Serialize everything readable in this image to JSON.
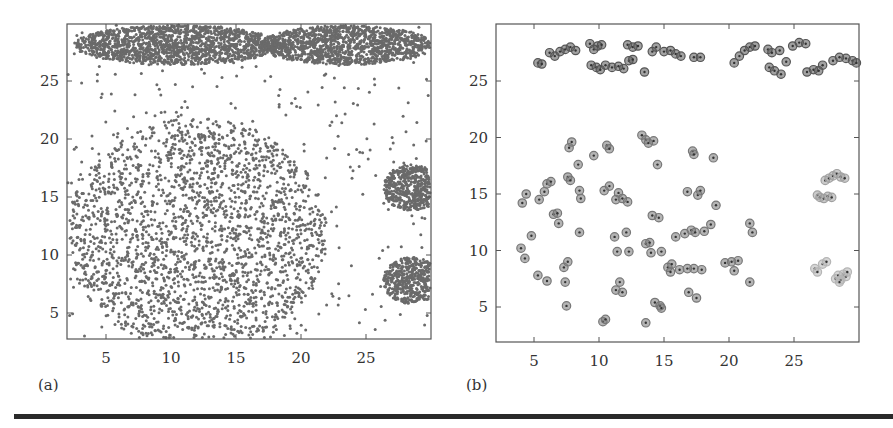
{
  "chart_data": [
    {
      "id": "a",
      "panel_label": "(a)",
      "type": "scatter",
      "title": "",
      "xlabel": "",
      "ylabel": "",
      "xlim": [
        2,
        30
      ],
      "ylim": [
        2,
        30
      ],
      "xticks": [
        5,
        10,
        15,
        20,
        25
      ],
      "yticks": [
        5,
        10,
        15,
        20,
        25
      ],
      "grid": false,
      "legend": null,
      "marker_color": "#6a6a6a",
      "description": "Raw dataset with two dense elongated ellipses at top joined by thin bridge, large sparse disc lower-left, two dense small discs at right edge, uniform background noise",
      "clusters": [
        {
          "name": "top-left-ellipse",
          "shape": "ellipse",
          "cx": 10.5,
          "cy": 28.1,
          "rx": 8.0,
          "ry": 1.7,
          "n": 1500
        },
        {
          "name": "top-right-ellipse",
          "shape": "ellipse",
          "cx": 23.5,
          "cy": 28.1,
          "rx": 6.7,
          "ry": 1.7,
          "n": 1300
        },
        {
          "name": "bridge",
          "shape": "line",
          "x0": 15.5,
          "x1": 19.0,
          "y": 28.0,
          "n": 40
        },
        {
          "name": "large-disc",
          "shape": "ellipse",
          "cx": 12.0,
          "cy": 11.8,
          "rx": 10.0,
          "ry": 10.0,
          "n": 2200
        },
        {
          "name": "right-upper-disc",
          "shape": "ellipse",
          "cx": 28.5,
          "cy": 15.8,
          "rx": 2.2,
          "ry": 2.0,
          "n": 500
        },
        {
          "name": "right-lower-disc",
          "shape": "ellipse",
          "cx": 28.5,
          "cy": 7.8,
          "rx": 2.2,
          "ry": 2.0,
          "n": 500
        },
        {
          "name": "noise",
          "shape": "uniform",
          "x0": 2,
          "x1": 30,
          "y0": 2,
          "y1": 30,
          "n": 420
        }
      ]
    },
    {
      "id": "b",
      "panel_label": "(b)",
      "type": "scatter",
      "title": "",
      "xlabel": "",
      "ylabel": "",
      "xlim": [
        2,
        30
      ],
      "ylim": [
        2,
        30
      ],
      "xticks": [
        5,
        10,
        15,
        20,
        25
      ],
      "yticks": [
        5,
        10,
        15,
        20,
        25
      ],
      "grid": false,
      "legend": null,
      "description": "Representative points (circled markers) shaded by cluster",
      "series": [
        {
          "name": "top-cluster",
          "color": "#555555",
          "points": [
            [
              5.3,
              26.6
            ],
            [
              5.6,
              26.5
            ],
            [
              6.2,
              27.5
            ],
            [
              6.6,
              27.2
            ],
            [
              7.0,
              27.6
            ],
            [
              7.4,
              27.8
            ],
            [
              7.8,
              28.0
            ],
            [
              8.2,
              27.7
            ],
            [
              9.3,
              28.3
            ],
            [
              9.6,
              27.8
            ],
            [
              9.9,
              28.1
            ],
            [
              10.2,
              28.2
            ],
            [
              9.4,
              26.4
            ],
            [
              9.8,
              26.2
            ],
            [
              10.1,
              26.0
            ],
            [
              10.5,
              26.4
            ],
            [
              11.0,
              26.2
            ],
            [
              11.5,
              26.3
            ],
            [
              11.9,
              26.1
            ],
            [
              12.3,
              26.8
            ],
            [
              12.6,
              26.9
            ],
            [
              12.2,
              28.2
            ],
            [
              12.6,
              28.0
            ],
            [
              13.0,
              28.1
            ],
            [
              13.5,
              25.8
            ],
            [
              14.1,
              27.6
            ],
            [
              14.4,
              28.0
            ],
            [
              15.0,
              27.6
            ],
            [
              15.5,
              27.7
            ],
            [
              15.9,
              27.4
            ],
            [
              16.3,
              27.2
            ],
            [
              17.3,
              27.1
            ],
            [
              17.8,
              27.1
            ],
            [
              20.4,
              26.6
            ],
            [
              20.8,
              27.2
            ],
            [
              21.2,
              27.7
            ],
            [
              21.6,
              28.0
            ],
            [
              22.0,
              28.1
            ],
            [
              23.0,
              27.8
            ],
            [
              23.3,
              27.5
            ],
            [
              23.9,
              27.7
            ],
            [
              24.4,
              26.7
            ],
            [
              23.1,
              26.2
            ],
            [
              23.5,
              25.9
            ],
            [
              24.0,
              25.6
            ],
            [
              24.9,
              28.1
            ],
            [
              25.4,
              28.4
            ],
            [
              25.9,
              28.3
            ],
            [
              26.0,
              25.8
            ],
            [
              26.5,
              26.0
            ],
            [
              26.9,
              25.9
            ],
            [
              27.2,
              26.4
            ],
            [
              28.0,
              26.8
            ],
            [
              28.5,
              27.1
            ],
            [
              29.0,
              27.0
            ],
            [
              29.5,
              26.8
            ],
            [
              29.8,
              26.6
            ]
          ]
        },
        {
          "name": "disc-cluster",
          "color": "#777777",
          "points": [
            [
              4.1,
              14.2
            ],
            [
              4.4,
              15.0
            ],
            [
              5.4,
              14.5
            ],
            [
              5.8,
              15.2
            ],
            [
              6.0,
              15.9
            ],
            [
              6.3,
              16.1
            ],
            [
              6.5,
              13.2
            ],
            [
              7.6,
              16.5
            ],
            [
              7.8,
              16.2
            ],
            [
              7.7,
              19.1
            ],
            [
              7.9,
              19.6
            ],
            [
              8.4,
              17.6
            ],
            [
              8.5,
              15.3
            ],
            [
              8.6,
              14.6
            ],
            [
              9.6,
              18.4
            ],
            [
              10.4,
              15.3
            ],
            [
              10.8,
              15.7
            ],
            [
              10.6,
              19.3
            ],
            [
              10.8,
              19.0
            ],
            [
              11.3,
              14.5
            ],
            [
              11.5,
              15.1
            ],
            [
              11.8,
              14.6
            ],
            [
              12.2,
              14.3
            ],
            [
              13.3,
              20.2
            ],
            [
              13.6,
              19.8
            ],
            [
              13.8,
              19.5
            ],
            [
              14.2,
              19.7
            ],
            [
              14.5,
              17.6
            ],
            [
              16.8,
              15.2
            ],
            [
              17.6,
              14.9
            ],
            [
              17.8,
              15.3
            ],
            [
              17.2,
              18.8
            ],
            [
              17.3,
              18.5
            ],
            [
              18.8,
              18.2
            ],
            [
              19.0,
              14.0
            ],
            [
              14.1,
              13.1
            ],
            [
              14.6,
              12.9
            ],
            [
              4.0,
              10.2
            ],
            [
              4.3,
              9.3
            ],
            [
              4.8,
              11.3
            ],
            [
              5.3,
              7.8
            ],
            [
              6.0,
              7.3
            ],
            [
              6.8,
              13.3
            ],
            [
              6.9,
              12.4
            ],
            [
              7.3,
              8.5
            ],
            [
              7.4,
              7.2
            ],
            [
              7.6,
              9.0
            ],
            [
              7.5,
              5.1
            ],
            [
              8.5,
              11.6
            ],
            [
              10.3,
              3.7
            ],
            [
              10.5,
              3.9
            ],
            [
              11.2,
              11.2
            ],
            [
              11.4,
              9.9
            ],
            [
              11.6,
              7.2
            ],
            [
              11.3,
              6.5
            ],
            [
              11.8,
              6.3
            ],
            [
              12.1,
              11.6
            ],
            [
              12.3,
              9.9
            ],
            [
              13.6,
              10.6
            ],
            [
              13.9,
              10.7
            ],
            [
              14.0,
              9.8
            ],
            [
              14.3,
              5.4
            ],
            [
              14.7,
              5.1
            ],
            [
              14.8,
              4.9
            ],
            [
              14.8,
              9.9
            ],
            [
              15.3,
              8.5
            ],
            [
              15.5,
              8.1
            ],
            [
              15.6,
              8.8
            ],
            [
              15.9,
              11.2
            ],
            [
              16.2,
              8.3
            ],
            [
              16.6,
              11.5
            ],
            [
              17.1,
              11.8
            ],
            [
              17.4,
              11.6
            ],
            [
              16.8,
              8.4
            ],
            [
              17.3,
              8.4
            ],
            [
              17.9,
              8.3
            ],
            [
              16.9,
              6.3
            ],
            [
              17.5,
              5.8
            ],
            [
              18.1,
              11.7
            ],
            [
              18.6,
              12.3
            ],
            [
              19.7,
              8.9
            ],
            [
              20.2,
              9.0
            ],
            [
              20.4,
              8.2
            ],
            [
              20.7,
              9.1
            ],
            [
              21.6,
              12.4
            ],
            [
              21.8,
              11.6
            ],
            [
              21.6,
              7.2
            ],
            [
              13.6,
              3.6
            ]
          ]
        },
        {
          "name": "right-upper-cluster",
          "color": "#a0a0a0",
          "points": [
            [
              26.8,
              14.9
            ],
            [
              27.0,
              14.7
            ],
            [
              27.3,
              14.6
            ],
            [
              27.6,
              14.8
            ],
            [
              27.9,
              14.7
            ],
            [
              27.4,
              16.2
            ],
            [
              27.7,
              16.4
            ],
            [
              28.0,
              16.6
            ],
            [
              28.3,
              16.8
            ],
            [
              28.6,
              16.5
            ],
            [
              28.9,
              16.4
            ]
          ]
        },
        {
          "name": "right-lower-cluster",
          "color": "#b5b5b5",
          "points": [
            [
              26.6,
              8.4
            ],
            [
              26.8,
              8.1
            ],
            [
              27.2,
              8.8
            ],
            [
              27.5,
              9.0
            ],
            [
              28.2,
              7.5
            ],
            [
              28.4,
              7.8
            ],
            [
              28.6,
              7.4
            ],
            [
              28.8,
              7.9
            ],
            [
              29.0,
              7.7
            ],
            [
              29.1,
              8.1
            ],
            [
              28.5,
              7.2
            ]
          ]
        }
      ]
    }
  ]
}
